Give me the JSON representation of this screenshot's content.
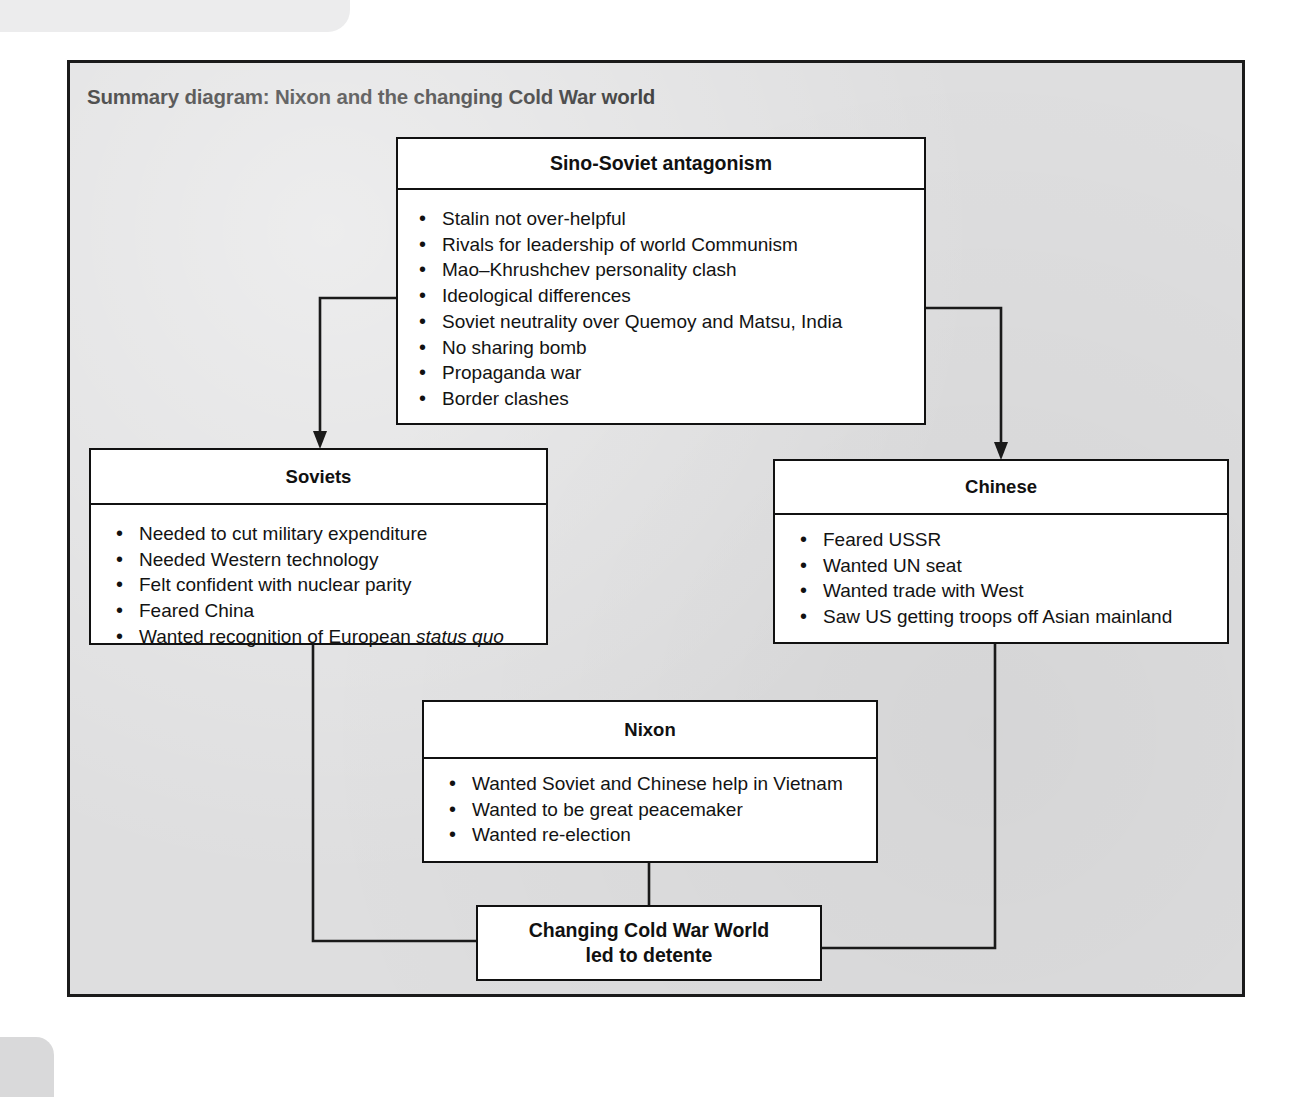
{
  "page": {
    "ghost_header_text": "1111 1",
    "background_color": "#ffffff",
    "panel_color": "#dededf",
    "line_color": "#1a1a1a"
  },
  "panel": {
    "title": "Summary diagram: Nixon and the changing Cold War world"
  },
  "diagram": {
    "type": "flowchart",
    "boxes": [
      {
        "id": "sino-soviet-antagonism",
        "title": "Sino-Soviet antagonism",
        "items": [
          "Stalin not over-helpful",
          "Rivals for leadership of world Communism",
          "Mao–Khrushchev personality clash",
          "Ideological differences",
          "Soviet neutrality over Quemoy and Matsu, India",
          "No sharing bomb",
          "Propaganda war",
          "Border clashes"
        ]
      },
      {
        "id": "soviets",
        "title": "Soviets",
        "items": [
          "Needed to cut military expenditure",
          "Needed Western technology",
          "Felt confident with nuclear parity",
          "Feared China"
        ],
        "last_item": {
          "before": "Wanted recognition of European ",
          "italic": "status quo",
          "after": ""
        }
      },
      {
        "id": "chinese",
        "title": "Chinese",
        "items": [
          "Feared USSR",
          "Wanted UN seat",
          "Wanted trade with West",
          "Saw US getting troops off Asian mainland"
        ]
      },
      {
        "id": "nixon",
        "title": "Nixon",
        "items": [
          "Wanted Soviet and Chinese help in Vietnam",
          "Wanted to be great peacemaker",
          "Wanted re-election"
        ]
      },
      {
        "id": "outcome",
        "line1": "Changing Cold War World",
        "line2": "led to detente"
      }
    ],
    "connections": [
      {
        "from": "sino-soviet-antagonism",
        "to": "soviets",
        "arrow": true
      },
      {
        "from": "sino-soviet-antagonism",
        "to": "chinese",
        "arrow": true
      },
      {
        "from": "soviets",
        "to": "outcome",
        "arrow": false
      },
      {
        "from": "chinese",
        "to": "outcome",
        "arrow": false
      },
      {
        "from": "nixon",
        "to": "outcome",
        "arrow": false
      }
    ]
  }
}
